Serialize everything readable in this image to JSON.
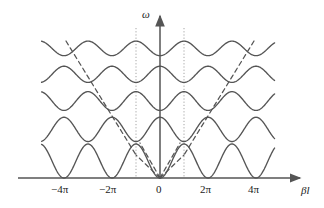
{
  "figure": {
    "type": "dispersion-diagram",
    "axes": {
      "x_label": "βl",
      "y_label": "ω",
      "x_label_name": "beta-l",
      "y_label_name": "omega",
      "x_ticks": [
        {
          "label": "−4π",
          "value": -12.566
        },
        {
          "label": "−2π",
          "value": -6.283
        },
        {
          "label": "0",
          "value": 0
        },
        {
          "label": "2π",
          "value": 6.283
        },
        {
          "label": "4π",
          "value": 12.566
        }
      ],
      "y_ticks": [],
      "axis_color": "#555555",
      "origin_label": "0"
    },
    "guides": {
      "dotted_vertical_lines_at": [
        "−π",
        "π"
      ],
      "dotted_color": "#999999",
      "dashed_light_line_color": "#555555"
    },
    "curve_color": "#555555"
  },
  "chart_data": {
    "type": "line",
    "title": "",
    "xlabel": "βl",
    "ylabel": "ω",
    "xlim": [
      -15.5,
      15.0
    ],
    "ylim": [
      0,
      1.0
    ],
    "grid": false,
    "legend": "none",
    "x_tick_labels": [
      "−4π",
      "−2π",
      "0",
      "2π",
      "4π"
    ],
    "x_tick_values": [
      -12.566,
      -6.283,
      0,
      6.283,
      12.566
    ],
    "annotations": [
      {
        "text": "dotted vertical line",
        "x": -3.1416
      },
      {
        "text": "dotted vertical line",
        "x": 3.1416
      },
      {
        "text": "dashed light line through origin, slope +",
        "from_x": 0,
        "to_x": 3.1416
      },
      {
        "text": "dashed light line through origin, slope −",
        "from_x": 0,
        "to_x": -3.1416
      },
      {
        "text": "dashed light line, left branch",
        "from_x": -11.0,
        "to_x": -3.1416
      },
      {
        "text": "dashed light line, right branch",
        "from_x": 3.1416,
        "to_x": 11.0
      }
    ],
    "series": [
      {
        "name": "band-1",
        "phase": "min-at-even-2pi",
        "center": 0.105,
        "amplitude": 0.105,
        "period_beta_l": 6.283
      },
      {
        "name": "band-2",
        "phase": "max-at-even-2pi",
        "center": 0.3,
        "amplitude": 0.075,
        "period_beta_l": 6.283
      },
      {
        "name": "band-3",
        "phase": "min-at-even-2pi",
        "center": 0.475,
        "amplitude": 0.058,
        "period_beta_l": 6.283
      },
      {
        "name": "band-4",
        "phase": "max-at-even-2pi",
        "center": 0.64,
        "amplitude": 0.05,
        "period_beta_l": 6.283
      },
      {
        "name": "band-5",
        "phase": "min-at-even-2pi",
        "center": 0.8,
        "amplitude": 0.045,
        "period_beta_l": 6.283
      }
    ]
  }
}
